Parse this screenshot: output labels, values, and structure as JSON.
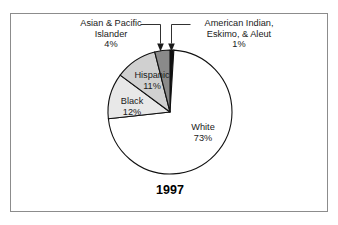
{
  "figure": {
    "year_label": "1997",
    "frame_color": "#8c8c8c",
    "background": "#ffffff"
  },
  "chart_data": {
    "type": "pie",
    "title": "1997",
    "total_percent": 101,
    "start_angle_deg": 0,
    "direction": "clockwise",
    "categories": [
      "American Indian, Eskimo, & Aleut",
      "White",
      "Black",
      "Hispanic",
      "Asian & Pacific Islander"
    ],
    "values": [
      1,
      73,
      12,
      11,
      4
    ],
    "slices": [
      {
        "name": "American Indian, Eskimo, & Aleut",
        "label": "American Indian,\nEskimo, & Aleut",
        "label_line1": "American Indian,",
        "label_line2": "Eskimo, & Aleut",
        "value": 1,
        "percent_text": "1%",
        "color": "#111111",
        "label_position": "outside-right",
        "has_leader": true
      },
      {
        "name": "White",
        "label": "White",
        "value": 73,
        "percent_text": "73%",
        "color": "#ffffff",
        "label_position": "inside",
        "has_leader": false
      },
      {
        "name": "Black",
        "label": "Black",
        "value": 12,
        "percent_text": "12%",
        "color": "#e8e8e8",
        "label_position": "inside",
        "has_leader": false
      },
      {
        "name": "Hispanic",
        "label": "Hispanic",
        "value": 11,
        "percent_text": "11%",
        "color": "#d0d0d0",
        "label_position": "inside",
        "has_leader": false
      },
      {
        "name": "Asian & Pacific Islander",
        "label": "Asian & Pacific\nIslander",
        "label_line1": "Asian & Pacific",
        "label_line2": "Islander",
        "value": 4,
        "percent_text": "4%",
        "color": "#8a8a8a",
        "label_position": "outside-left",
        "has_leader": true
      }
    ],
    "legend": "none",
    "grid": false,
    "xlabel": "",
    "ylabel": ""
  }
}
